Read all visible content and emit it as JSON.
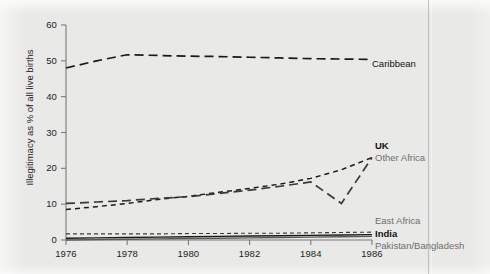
{
  "chart_data": {
    "type": "line",
    "title": "",
    "xlabel": "",
    "ylabel": "Illegitimacy as % of all live births",
    "xlim": [
      1976,
      1986
    ],
    "ylim": [
      0,
      60
    ],
    "yticks": [
      0,
      10,
      20,
      30,
      40,
      50,
      60
    ],
    "xticks": [
      1976,
      1978,
      1980,
      1982,
      1984,
      1986
    ],
    "grid": false,
    "legend_position": "right-inline",
    "x": [
      1976,
      1977,
      1978,
      1979,
      1980,
      1981,
      1982,
      1983,
      1984,
      1985,
      1986
    ],
    "series": [
      {
        "name": "Caribbean",
        "dash": "long-dash",
        "color": "#1a1a1a",
        "label_color": "#111111",
        "values": [
          48.0,
          50.0,
          51.7,
          51.5,
          51.3,
          51.2,
          51.0,
          50.8,
          50.6,
          50.5,
          50.4
        ]
      },
      {
        "name": "UK",
        "dash": "short-dash",
        "color": "#1a1a1a",
        "label_color": "#111111",
        "values": [
          8.5,
          9.3,
          10.2,
          11.3,
          12.2,
          13.3,
          14.4,
          15.6,
          17.2,
          19.6,
          23.0
        ]
      },
      {
        "name": "Other Africa",
        "dash": "long-dash",
        "color": "#3a3a3a",
        "label_color": "#6e6e6e",
        "values": [
          10.2,
          10.6,
          11.0,
          11.6,
          12.1,
          13.0,
          13.9,
          15.0,
          16.2,
          10.2,
          23.0
        ]
      },
      {
        "name": "East Africa",
        "dash": "fine-dash",
        "color": "#3a3a3a",
        "label_color": "#6e6e6e",
        "values": [
          1.7,
          1.7,
          1.7,
          1.7,
          1.8,
          1.8,
          1.9,
          1.9,
          2.0,
          2.1,
          2.2
        ]
      },
      {
        "name": "India",
        "dash": "solid",
        "color": "#1a1a1a",
        "label_color": "#111111",
        "values": [
          0.5,
          0.6,
          0.7,
          0.8,
          0.9,
          1.0,
          1.1,
          1.2,
          1.3,
          1.4,
          1.5
        ]
      },
      {
        "name": "Pakistan/Bangladesh",
        "dash": "solid",
        "color": "#5a5a5a",
        "label_color": "#6e6e6e",
        "values": [
          0.0,
          0.1,
          0.2,
          0.3,
          0.4,
          0.5,
          0.6,
          0.7,
          0.8,
          0.9,
          1.0
        ]
      }
    ]
  },
  "axis": {
    "y_tick_labels": [
      "0",
      "10",
      "20",
      "30",
      "40",
      "50",
      "60"
    ],
    "x_tick_labels": [
      "1976",
      "1978",
      "1980",
      "1982",
      "1984",
      "1986"
    ],
    "y_axis_title": "Illegitimacy as % of all live births"
  },
  "labels": {
    "caribbean": "Caribbean",
    "uk": "UK",
    "other_africa": "Other Africa",
    "east_africa": "East Africa",
    "india": "India",
    "pakistan_bangladesh": "Pakistan/Bangladesh"
  },
  "colors": {
    "background": "#e9e9e7",
    "ink": "#1a1a1a",
    "grey_ink": "#6e6e6e",
    "axis": "#6b6b6b"
  }
}
